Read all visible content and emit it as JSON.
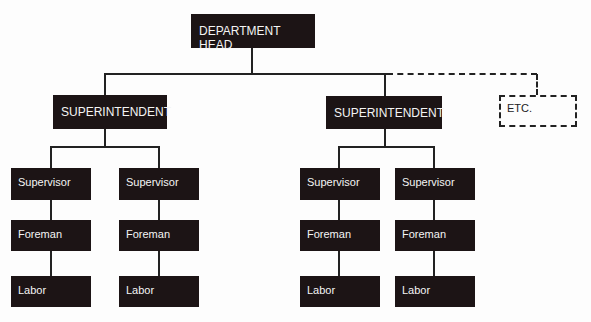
{
  "chart": {
    "head": "DEPARTMENT HEAD",
    "superintendents": [
      {
        "label": "SUPERINTENDENT",
        "chains": [
          {
            "supervisor": "Supervisor",
            "foreman": "Foreman",
            "labor": "Labor"
          },
          {
            "supervisor": "Supervisor",
            "foreman": "Foreman",
            "labor": "Labor"
          }
        ]
      },
      {
        "label": "SUPERINTENDENT",
        "chains": [
          {
            "supervisor": "Supervisor",
            "foreman": "Foreman",
            "labor": "Labor"
          },
          {
            "supervisor": "Supervisor",
            "foreman": "Foreman",
            "labor": "Labor"
          }
        ]
      }
    ],
    "etc": "ETC."
  },
  "colors": {
    "box": "#1c1415",
    "box_text": "#f4f4f4",
    "line": "#222222",
    "background": "#fdfdfd"
  }
}
